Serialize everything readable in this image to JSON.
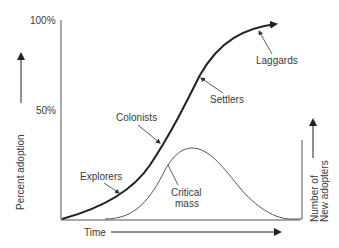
{
  "diagram": {
    "type": "technology-adoption-curve",
    "y_axis": {
      "label": "Percent adoption",
      "ticks": [
        "100%",
        "50%"
      ]
    },
    "x_axis": {
      "label": "Time"
    },
    "secondary_axis": {
      "label_line1": "Number of",
      "label_line2": "New adopters"
    },
    "cumulative_curve_annotations": [
      "Explorers",
      "Colonists",
      "Settlers",
      "Laggards"
    ],
    "bell_curve_annotation_line1": "Critical",
    "bell_curve_annotation_line2": "mass",
    "colors": {
      "line": "#222222",
      "thin_line": "#555555",
      "text": "#3a3a3a",
      "background": "#ffffff"
    }
  }
}
